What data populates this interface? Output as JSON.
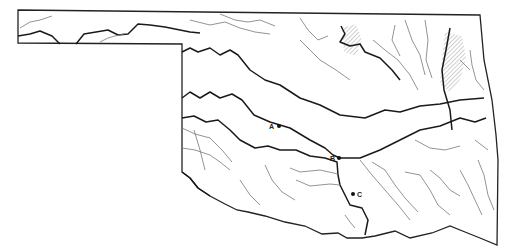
{
  "map": {
    "region": "Oklahoma",
    "description": "Outline map of Oklahoma showing major and minor rivers, with hatched reservoir areas in the northeast",
    "points": [
      {
        "label": "A",
        "x": 278,
        "y": 126
      },
      {
        "label": "B",
        "x": 338,
        "y": 158
      },
      {
        "label": "C",
        "x": 354,
        "y": 194
      }
    ],
    "colors": {
      "line": "#1a1a1a",
      "minor_line": "#777777",
      "background": "#ffffff"
    }
  }
}
